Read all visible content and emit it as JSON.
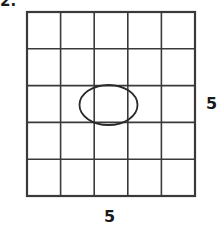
{
  "figure": {
    "problem_number": "2.",
    "type": "grid-with-inscribed-ellipse",
    "grid": {
      "columns": 5,
      "rows": 5,
      "line_color": "#3a3a3a",
      "fill_color": "#ffffff",
      "outer_line_width": 2,
      "inner_line_width": 1.6,
      "left": 27,
      "top": 12,
      "right": 195,
      "bottom": 196
    },
    "ellipse": {
      "name": "inscribed-ellipse",
      "center_x": 108.5,
      "center_y": 105,
      "radius_x": 29,
      "radius_y": 20,
      "stroke_color": "#2a2a2a",
      "stroke_width": 1.8,
      "fill": "none"
    },
    "labels": {
      "right_dimension": "5",
      "bottom_dimension": "5"
    }
  }
}
